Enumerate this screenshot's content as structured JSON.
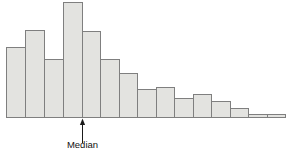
{
  "chart_data": {
    "type": "bar",
    "title": "",
    "subtitle": "",
    "xlabel": "",
    "ylabel": "",
    "grid": false,
    "legend": null,
    "legend_position": "none",
    "axis_ranges": {
      "x_pixel_range": [
        6,
        285
      ],
      "y_pixel_baseline": 117,
      "y_pixel_top": 2,
      "ylim": [
        0,
        100
      ]
    },
    "bin_edges_px": [
      6,
      25,
      44,
      63,
      82,
      100,
      119,
      137,
      156,
      174,
      193,
      211,
      230,
      248,
      267,
      285
    ],
    "categories": [
      "bin-1",
      "bin-2",
      "bin-3",
      "bin-4",
      "bin-5",
      "bin-6",
      "bin-7",
      "bin-8",
      "bin-9",
      "bin-10",
      "bin-11",
      "bin-12",
      "bin-13",
      "bin-14",
      "bin-15"
    ],
    "values": [
      61,
      76,
      50,
      100,
      75,
      50,
      38,
      24,
      26,
      17,
      20,
      14,
      8,
      3,
      3
    ],
    "bar_tops_px": [
      47,
      30,
      59,
      2,
      31,
      59,
      73,
      89,
      87,
      98,
      94,
      101,
      108,
      114,
      114
    ],
    "series": [
      {
        "name": "frequency",
        "values": [
          61,
          76,
          50,
          100,
          75,
          50,
          38,
          24,
          26,
          17,
          20,
          14,
          8,
          3,
          3
        ]
      }
    ],
    "annotations": [
      {
        "label": "Median",
        "x_px": 82,
        "arrow_from_y_px": 143,
        "arrow_to_y_px": 119,
        "label_y_px": 141
      }
    ],
    "colors": {
      "bar_fill": "#e3e3e0",
      "bar_stroke": "#7f7f7f",
      "background": "#ffffff",
      "annotation": "#1a1a1a"
    }
  },
  "figure": {
    "caption": "",
    "median_label": "Median"
  }
}
